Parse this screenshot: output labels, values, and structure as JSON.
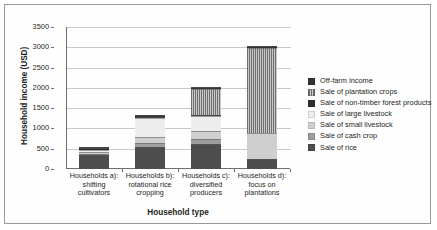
{
  "chart_data": {
    "type": "bar",
    "subtype": "stacked-bar",
    "title": "",
    "xlabel": "Household type",
    "ylabel": "Household income (USD)",
    "ylim": [
      0,
      3500
    ],
    "ytick_step": 500,
    "yticks": [
      "3500",
      "3000",
      "2500",
      "2000",
      "1500",
      "1000",
      "500",
      "0"
    ],
    "grid": true,
    "legend_position": "right",
    "categories": [
      "Households a): shifting cultivators",
      "Households b): rotational rice cropping",
      "Households c): diversified producers",
      "Households d): focus on plantations"
    ],
    "category_lines": [
      [
        "Households a):",
        "shifting",
        "cultivators"
      ],
      [
        "Households b):",
        "rotational rice",
        "cropping"
      ],
      [
        "Households c):",
        "diversified",
        "producers"
      ],
      [
        "Households d):",
        "focus on",
        "plantations"
      ]
    ],
    "stack_order_bottom_to_top": [
      "Sale of rice",
      "Sale of cash crop",
      "Sale of small livestock",
      "Sale of large livestock",
      "Sale of non-timber forest products",
      "Sale of plantation crops",
      "Off-farm income"
    ],
    "series": [
      {
        "name": "Sale of rice",
        "color": "#4d4d4d",
        "pattern": "solid",
        "values": [
          340,
          540,
          610,
          250
        ]
      },
      {
        "name": "Sale of cash crop",
        "color": "#9e9e9e",
        "pattern": "solid",
        "values": [
          40,
          110,
          120,
          0
        ]
      },
      {
        "name": "Sale of small livestock",
        "color": "#cfcfcf",
        "pattern": "solid",
        "values": [
          40,
          130,
          200,
          630
        ]
      },
      {
        "name": "Sale of large livestock",
        "color": "#ededed",
        "pattern": "solid",
        "values": [
          60,
          470,
          380,
          0
        ]
      },
      {
        "name": "Sale of non-timber forest products",
        "color": "#2f2f2f",
        "pattern": "solid",
        "values": [
          30,
          20,
          30,
          0
        ]
      },
      {
        "name": "Sale of plantation crops",
        "color": "#b3b3b3",
        "pattern": "hatch-vertical",
        "values": [
          0,
          20,
          640,
          2110
        ]
      },
      {
        "name": "Off-farm income",
        "color": "#333333",
        "pattern": "solid",
        "values": [
          40,
          30,
          30,
          40
        ]
      }
    ],
    "totals": [
      550,
      1320,
      2010,
      3030
    ]
  },
  "legend": {
    "items": [
      {
        "label": "Off-farm income"
      },
      {
        "label": "Sale of plantation crops"
      },
      {
        "label": "Sale of non-timber forest products"
      },
      {
        "label": "Sale of large livestock"
      },
      {
        "label": "Sale of small livestock"
      },
      {
        "label": "Sale of cash crop"
      },
      {
        "label": "Sale of rice"
      }
    ]
  }
}
